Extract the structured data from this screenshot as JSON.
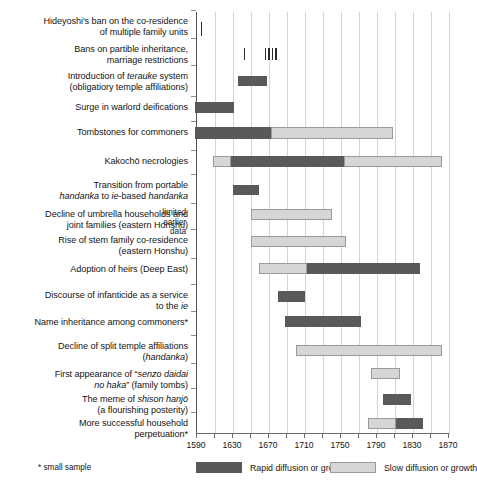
{
  "chart_data": {
    "type": "bar",
    "title": "",
    "subtitle": "",
    "xlabel": "",
    "ylabel": "",
    "orientation": "horizontal",
    "xlim": [
      1590,
      1870
    ],
    "tick_interval": 20,
    "label_interval": 40,
    "grid": true,
    "tick_labels": [
      "1590",
      "1630",
      "1670",
      "1710",
      "1750",
      "1790",
      "1830",
      "1870"
    ],
    "minor_ticks": [
      1590,
      1610,
      1630,
      1650,
      1670,
      1690,
      1710,
      1730,
      1750,
      1770,
      1790,
      1810,
      1830,
      1850,
      1870
    ],
    "legend_position": "bottom",
    "legend": [
      {
        "key": "rapid",
        "label": "Rapid diffusion or growth",
        "color": "#595959"
      },
      {
        "key": "slow",
        "label": "Slow diffusion or growth",
        "color": "#d6d6d6"
      }
    ],
    "footnote": "* small sample",
    "annotations": [
      {
        "text": "limited\nearlier\ndata",
        "near_rows": [
          7,
          8
        ]
      }
    ],
    "categories": [
      "Hideyoshi's ban on the co-residence of multiple family units",
      "Bans on partible inheritance, marriage restrictions",
      "Introduction of terauke system (obligatiory temple affiliations)",
      "Surge in warlord deifications",
      "Tombstones for commoners",
      "Kakochō necrologies",
      "Transition from portable handanka to ie-based handanka",
      "Decline of umbrella households and joint families (eastern Honshu)",
      "Rise of stem family co-residence (eastern Honshu)",
      "Adoption of heirs (Deep East)",
      "Discourse of infanticide as a service to the ie",
      "Name inheritance among commoners*",
      "Decline of split temple affiliations (handanka)",
      "First appearance of \"senzo daidai no haka\" (family tombs)",
      "The meme of shison hanjō (a flourishing posterity)",
      "More successful household perpetuation*"
    ],
    "rows": [
      {
        "index": 0,
        "label_lines": [
          [
            {
              "t": "Hideyoshi's ban on the co-residence",
              "i": false
            }
          ],
          [
            {
              "t": "of multiple family units",
              "i": false
            }
          ]
        ],
        "segments": [
          {
            "kind": "rapid",
            "start": 1594,
            "end": 1595,
            "event": true
          }
        ]
      },
      {
        "index": 1,
        "label_lines": [
          [
            {
              "t": "Bans on partible inheritance,",
              "i": false
            }
          ],
          [
            {
              "t": "marriage restrictions",
              "i": false
            }
          ]
        ],
        "segments": [
          {
            "kind": "rapid",
            "start": 1642,
            "end": 1643,
            "event": true
          },
          {
            "kind": "rapid",
            "start": 1665,
            "end": 1666,
            "event": true
          },
          {
            "kind": "rapid",
            "start": 1669,
            "end": 1670,
            "event": true
          },
          {
            "kind": "rapid",
            "start": 1673,
            "end": 1675,
            "event": true
          },
          {
            "kind": "rapid",
            "start": 1677,
            "end": 1679,
            "event": true
          }
        ]
      },
      {
        "index": 2,
        "label_lines": [
          [
            {
              "t": "Introduction of ",
              "i": false
            },
            {
              "t": "terauke",
              "i": true
            },
            {
              "t": " system",
              "i": false
            }
          ],
          [
            {
              "t": "(obligatiory temple affiliations)",
              "i": false
            }
          ]
        ],
        "segments": [
          {
            "kind": "rapid",
            "start": 1635,
            "end": 1668,
            "event": false
          }
        ]
      },
      {
        "index": 3,
        "label_lines": [
          [
            {
              "t": "Surge in warlord deifications",
              "i": false
            }
          ]
        ],
        "segments": [
          {
            "kind": "rapid",
            "start": 1588,
            "end": 1631,
            "event": false
          }
        ]
      },
      {
        "index": 4,
        "label_lines": [
          [
            {
              "t": "Tombstones for commoners",
              "i": false
            }
          ]
        ],
        "segments": [
          {
            "kind": "rapid",
            "start": 1588,
            "end": 1672,
            "event": false
          },
          {
            "kind": "slow",
            "start": 1672,
            "end": 1808,
            "event": false
          }
        ]
      },
      {
        "index": 5,
        "label_lines": [
          [
            {
              "t": "Kakochō necrologies",
              "i": false
            }
          ]
        ],
        "segments": [
          {
            "kind": "slow",
            "start": 1608,
            "end": 1628,
            "event": false
          },
          {
            "kind": "rapid",
            "start": 1628,
            "end": 1753,
            "event": false
          },
          {
            "kind": "slow",
            "start": 1753,
            "end": 1862,
            "event": false
          }
        ]
      },
      {
        "index": 6,
        "label_lines": [
          [
            {
              "t": "Transition from portable",
              "i": false
            }
          ],
          [
            {
              "t": "handanka",
              "i": true
            },
            {
              "t": " to ",
              "i": false
            },
            {
              "t": "ie",
              "i": true
            },
            {
              "t": "-based ",
              "i": false
            },
            {
              "t": "handanka",
              "i": true
            }
          ]
        ],
        "segments": [
          {
            "kind": "rapid",
            "start": 1630,
            "end": 1659,
            "event": false
          }
        ]
      },
      {
        "index": 7,
        "label_lines": [
          [
            {
              "t": "Decline of umbrella households and",
              "i": false
            }
          ],
          [
            {
              "t": "joint families (eastern Honshu)",
              "i": false
            }
          ]
        ],
        "segments": [
          {
            "kind": "slow",
            "start": 1650,
            "end": 1740,
            "event": false
          }
        ]
      },
      {
        "index": 8,
        "label_lines": [
          [
            {
              "t": "Rise of stem family co-residence",
              "i": false
            }
          ],
          [
            {
              "t": "(eastern Honshu)",
              "i": false
            }
          ]
        ],
        "segments": [
          {
            "kind": "slow",
            "start": 1650,
            "end": 1756,
            "event": false
          }
        ]
      },
      {
        "index": 9,
        "label_lines": [
          [
            {
              "t": "Adoption of heirs (Deep East)",
              "i": false
            }
          ]
        ],
        "segments": [
          {
            "kind": "slow",
            "start": 1659,
            "end": 1712,
            "event": false
          },
          {
            "kind": "rapid",
            "start": 1712,
            "end": 1838,
            "event": false
          }
        ]
      },
      {
        "index": 10,
        "label_lines": [
          [
            {
              "t": "Discourse of infanticide as a service",
              "i": false
            }
          ],
          [
            {
              "t": "to the ",
              "i": false
            },
            {
              "t": "ie",
              "i": true
            }
          ]
        ],
        "segments": [
          {
            "kind": "rapid",
            "start": 1680,
            "end": 1710,
            "event": false
          }
        ]
      },
      {
        "index": 11,
        "label_lines": [
          [
            {
              "t": "Name inheritance among commoners*",
              "i": false
            }
          ]
        ],
        "segments": [
          {
            "kind": "rapid",
            "start": 1688,
            "end": 1772,
            "event": false
          }
        ]
      },
      {
        "index": 12,
        "label_lines": [
          [
            {
              "t": "Decline of split temple affiliations",
              "i": false
            }
          ],
          [
            {
              "t": "(",
              "i": false
            },
            {
              "t": "handanka",
              "i": true
            },
            {
              "t": ")",
              "i": false
            }
          ]
        ],
        "segments": [
          {
            "kind": "slow",
            "start": 1700,
            "end": 1862,
            "event": false
          }
        ]
      },
      {
        "index": 13,
        "label_lines": [
          [
            {
              "t": "First appearance of “",
              "i": false
            },
            {
              "t": "senzo daidai",
              "i": true
            }
          ],
          [
            {
              "t": "no haka",
              "i": true
            },
            {
              "t": "” (family tombs)",
              "i": false
            }
          ]
        ],
        "segments": [
          {
            "kind": "slow",
            "start": 1783,
            "end": 1816,
            "event": false
          }
        ]
      },
      {
        "index": 14,
        "label_lines": [
          [
            {
              "t": "The meme of ",
              "i": false
            },
            {
              "t": "shison hanjō",
              "i": true
            }
          ],
          [
            {
              "t": "(a flourishing posterity)",
              "i": false
            }
          ]
        ],
        "segments": [
          {
            "kind": "rapid",
            "start": 1797,
            "end": 1828,
            "event": false
          }
        ]
      },
      {
        "index": 15,
        "label_lines": [
          [
            {
              "t": "More successful household",
              "i": false
            }
          ],
          [
            {
              "t": "perpetuation*",
              "i": false
            }
          ]
        ],
        "segments": [
          {
            "kind": "slow",
            "start": 1780,
            "end": 1811,
            "event": false
          },
          {
            "kind": "rapid",
            "start": 1811,
            "end": 1841,
            "event": false
          }
        ]
      }
    ]
  }
}
